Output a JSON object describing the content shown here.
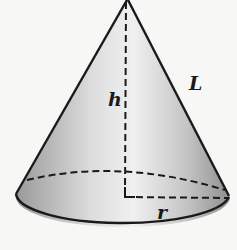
{
  "diagram": {
    "type": "geometry-figure",
    "labels": {
      "height": "h",
      "slant_height": "L",
      "radius": "r"
    },
    "colors": {
      "background": "#f7f7f5",
      "outline": "#1a1a1a",
      "shade_dark": "#8f8f8f",
      "shade_light": "#f2f2f2"
    }
  }
}
